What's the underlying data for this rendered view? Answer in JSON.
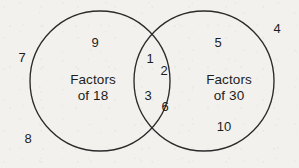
{
  "diagram": {
    "kind": "venn-diagram",
    "background_color": "#f2f1ee",
    "stroke_color": "#2b2b2b",
    "text_color": "#1d1d1d"
  },
  "sets": {
    "left": {
      "label_line1": "Factors",
      "label_line2": "of 18",
      "label_full": "Factors of 18",
      "cx": 100,
      "cy": 81,
      "r": 70
    },
    "right": {
      "label_line1": "Factors",
      "label_line2": "of 30",
      "label_full": "Factors of 30",
      "cx": 204,
      "cy": 81,
      "r": 70
    }
  },
  "members": {
    "left_only": [
      {
        "value": "9",
        "x": 95,
        "y": 47
      }
    ],
    "intersection": [
      {
        "value": "1",
        "x": 150,
        "y": 63
      },
      {
        "value": "2",
        "x": 164,
        "y": 75
      },
      {
        "value": "3",
        "x": 148,
        "y": 100
      },
      {
        "value": "6",
        "x": 165,
        "y": 111
      }
    ],
    "right_only": [
      {
        "value": "5",
        "x": 218,
        "y": 47
      },
      {
        "value": "10",
        "x": 224,
        "y": 131
      }
    ],
    "outside": [
      {
        "value": "7",
        "x": 22,
        "y": 62
      },
      {
        "value": "8",
        "x": 28,
        "y": 143
      },
      {
        "value": "4",
        "x": 277,
        "y": 33
      }
    ]
  }
}
